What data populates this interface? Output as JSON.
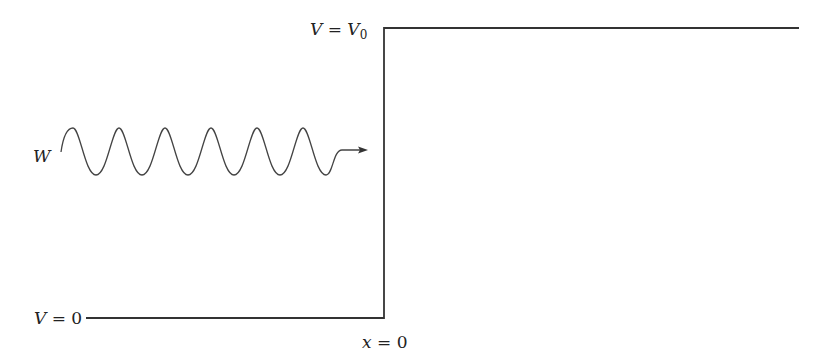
{
  "diagram": {
    "type": "potential-step",
    "labels": {
      "high_potential": {
        "var": "V",
        "eq": " = ",
        "val": "V",
        "sub": "0"
      },
      "low_potential": {
        "var": "V",
        "eq": " = ",
        "val": "0"
      },
      "boundary": {
        "var": "x",
        "eq": " = ",
        "val": "0"
      },
      "wave": "W"
    },
    "colors": {
      "line": "#333333",
      "text": "#222222",
      "background": "#ffffff"
    },
    "geometry": {
      "step_x": 384,
      "top_y": 28,
      "bottom_y": 318,
      "top_line_end_x": 799,
      "bottom_line_start_x": 86,
      "wave": {
        "start_x": 61,
        "center_y": 152,
        "amplitude": 23,
        "period": 46,
        "cycles": 6,
        "arrow_tip_x": 367
      }
    }
  }
}
